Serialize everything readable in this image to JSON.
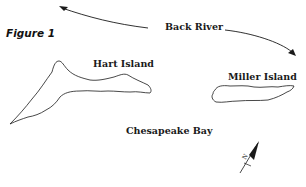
{
  "figure": {
    "title": "Figure 1"
  },
  "labels": {
    "river": "Back River",
    "island_1": "Hart Island",
    "island_2": "Miller Island",
    "bay": "Chesapeake Bay",
    "north": "N"
  },
  "colors": {
    "ink": "#1a1a1a",
    "background": "#ffffff"
  }
}
